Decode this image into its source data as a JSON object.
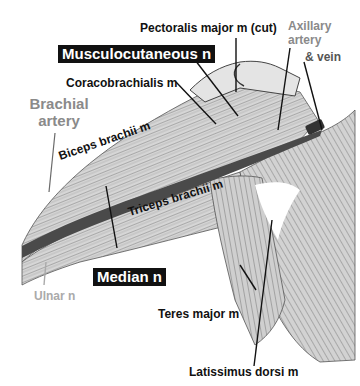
{
  "figure": {
    "type": "anatomical-illustration",
    "colors": {
      "background": "#ffffff",
      "label_black": "#111111",
      "label_gray": "#8a8a8a",
      "box_fill": "#111111",
      "box_text": "#ffffff",
      "artery": "#4a4a4a"
    }
  },
  "labels": {
    "pectoralis_major": "Pectoralis major m (cut)",
    "musculocutaneous": "Musculocutaneous n",
    "coracobrachialis": "Coracobrachialis m",
    "brachial_artery_line1": "Brachial",
    "brachial_artery_line2": "artery",
    "axillary_line1": "Axillary",
    "axillary_line2": "artery",
    "axillary_line3": "& vein",
    "biceps": "Biceps brachii m",
    "triceps": "Triceps brachii m",
    "median": "Median n",
    "ulnar": "Ulnar n",
    "teres_major": "Teres major m",
    "latissimus": "Latissimus dorsi m"
  }
}
